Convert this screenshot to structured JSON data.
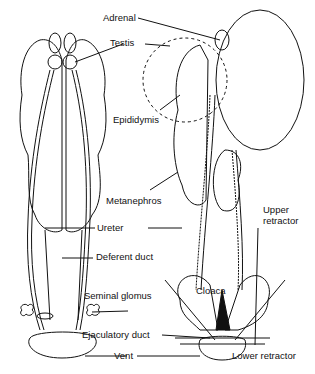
{
  "diagram": {
    "type": "anatomical illustration",
    "labels": {
      "adrenal": "Adrenal",
      "testis": "Testis",
      "epididymis": "Epididymis",
      "metanephros": "Metanephros",
      "ureter": "Ureter",
      "upper_retractor_1": "Upper",
      "upper_retractor_2": "retractor",
      "deferent_duct": "Deferent duct",
      "seminal_glomus": "Seminal glomus",
      "cloaca": "Cloaca",
      "ejaculatory_duct": "Ejaculatory duct",
      "vent": "Vent",
      "lower_retractor": "Lower retractor"
    },
    "colors": {
      "ink": "#111111",
      "background": "#ffffff"
    }
  }
}
